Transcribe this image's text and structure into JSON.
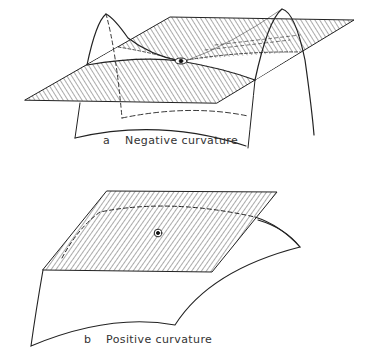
{
  "figure": {
    "panel_a": {
      "letter": "a",
      "caption": "Negative curvature"
    },
    "panel_b": {
      "letter": "b",
      "caption": "Positive curvature"
    }
  },
  "colors": {
    "ink": "#222222",
    "background": "#ffffff"
  }
}
